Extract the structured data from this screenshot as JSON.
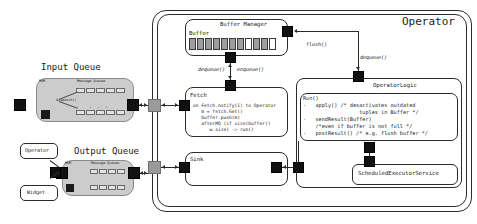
{
  "diagram": {
    "outer_label": "Operator"
  },
  "left": {
    "input_queue_title": "Input Queue",
    "output_queue_title": "Output Queue",
    "legend": {
      "operator_label": "Operator",
      "widget_label": "Widget"
    },
    "queue_internals": {
      "mom_label": "MOM",
      "message_queues_label": "Message Queues",
      "dispatch_label": "dispatch()",
      "ellipsis": ". . ."
    }
  },
  "buffer_manager": {
    "title": "Buffer Manager",
    "buffer_label": "Buffer",
    "cells": [
      "filled",
      "filled",
      "filled",
      "filled",
      "filled",
      "filled",
      "filled",
      "empty",
      "filled",
      "filled",
      "empty"
    ]
  },
  "fetch": {
    "title": "Fetch",
    "code": [
      "on Fetch.notify(I) to Operator",
      "   m = fetch.Get()",
      "   buffer.push(m)",
      "   afterMQ (if size(buffer))",
      "      w.size) -> run()"
    ]
  },
  "sink": {
    "title": "Sink"
  },
  "operator_logic": {
    "title": "OperatorLogic",
    "code": [
      "Run()",
      "·   apply() /* desactivates outdated",
      "                  tuples in Buffer */",
      "·   sendResult(Buffer)",
      "    /*even if buffer is not full */",
      "·   postResult() /* e.g. flush buffer */"
    ],
    "executor_label": "ScheduledExecutorService"
  },
  "arrows": {
    "flush": "flush()",
    "dequeue_left": "dequeue()",
    "enqueue": "enqueue()",
    "dequeue_right": "dequeue()"
  },
  "colors": {
    "port": "#111111",
    "port_connector": "#9a9a9a",
    "stroke": "#2b2b2b",
    "queue_fill": "#cccccc",
    "buffer_filled": "#9e9e9e",
    "buffer_empty": "#ffffff"
  }
}
